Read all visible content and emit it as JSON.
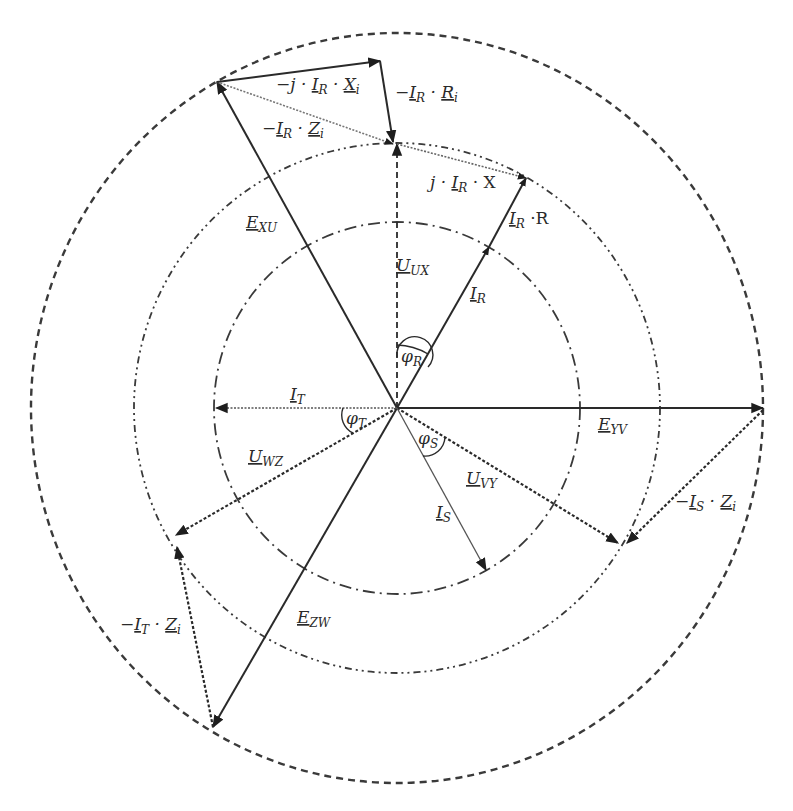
{
  "diagram": {
    "type": "phasor-diagram",
    "center": [
      397,
      408
    ],
    "colors": {
      "line": "#2a2a2a",
      "circle": "#3a3a3a",
      "background": "#ffffff"
    },
    "circles": [
      {
        "name": "outer-circle",
        "rx": 366,
        "ry": 375,
        "style": "dashed"
      },
      {
        "name": "middle-circle",
        "rx": 263,
        "ry": 265,
        "style": "dash-dot-dot"
      },
      {
        "name": "inner-circle",
        "rx": 183,
        "ry": 186,
        "style": "dash-dot"
      }
    ],
    "phasors": [
      {
        "name": "E_XU",
        "label": "E",
        "sub": "XU",
        "from": [
          397,
          408
        ],
        "to": [
          217,
          82
        ],
        "style": "solid"
      },
      {
        "name": "E_YV",
        "label": "E",
        "sub": "YV",
        "from": [
          397,
          408
        ],
        "to": [
          763,
          408
        ],
        "style": "solid"
      },
      {
        "name": "E_ZW",
        "label": "E",
        "sub": "ZW",
        "from": [
          397,
          408
        ],
        "to": [
          213,
          727
        ],
        "style": "solid"
      },
      {
        "name": "U_UX",
        "label": "U",
        "sub": "UX",
        "from": [
          397,
          408
        ],
        "to": [
          397,
          144
        ],
        "style": "dashed"
      },
      {
        "name": "U_VY",
        "label": "U",
        "sub": "VY",
        "from": [
          397,
          408
        ],
        "to": [
          618,
          543
        ],
        "style": "dotted-heavy"
      },
      {
        "name": "U_WZ",
        "label": "U",
        "sub": "WZ",
        "from": [
          397,
          408
        ],
        "to": [
          176,
          535
        ],
        "style": "dotted-heavy"
      },
      {
        "name": "I_R",
        "label": "I",
        "sub": "R",
        "from": [
          397,
          408
        ],
        "to": [
          489,
          247
        ],
        "style": "solid"
      },
      {
        "name": "I_S",
        "label": "I",
        "sub": "S",
        "from": [
          397,
          408
        ],
        "to": [
          486,
          570
        ],
        "style": "thin"
      },
      {
        "name": "I_T",
        "label": "I",
        "sub": "T",
        "from": [
          397,
          408
        ],
        "to": [
          216,
          408
        ],
        "style": "dotted"
      },
      {
        "name": "I_R_R",
        "label": "I_R · R",
        "from": [
          489,
          247
        ],
        "to": [
          526,
          178
        ],
        "style": "solid"
      },
      {
        "name": "j_I_R_X",
        "label": "j · I_R · X",
        "from": [
          397,
          144
        ],
        "to": [
          526,
          178
        ],
        "style": "dotted"
      },
      {
        "name": "minus_I_R_Z_i",
        "label": "−I_R · Z_i",
        "from": [
          217,
          82
        ],
        "to": [
          393,
          144
        ],
        "style": "dotted"
      },
      {
        "name": "minus_j_I_R_X_i",
        "label": "−j · I_R · X_i",
        "from": [
          217,
          82
        ],
        "to": [
          380,
          61
        ],
        "style": "solid"
      },
      {
        "name": "minus_I_R_R_i",
        "label": "−I_R · R_i",
        "from": [
          380,
          61
        ],
        "to": [
          393,
          142
        ],
        "style": "solid"
      },
      {
        "name": "minus_I_S_Z_i",
        "label": "−I_S · Z_i",
        "from": [
          763,
          410
        ],
        "to": [
          627,
          543
        ],
        "style": "dotted-heavy"
      },
      {
        "name": "minus_I_T_Z_i",
        "label": "−I_T · Z_i",
        "from": [
          213,
          727
        ],
        "to": [
          177,
          547
        ],
        "style": "dotted-heavy"
      }
    ],
    "angles": [
      {
        "name": "phi_R",
        "label": "φ",
        "sub": "R"
      },
      {
        "name": "phi_S",
        "label": "φ",
        "sub": "S"
      },
      {
        "name": "phi_T",
        "label": "φ",
        "sub": "T"
      }
    ],
    "labels": {
      "e_xu": {
        "main": "E",
        "sub": "XU"
      },
      "e_yv": {
        "main": "E",
        "sub": "YV"
      },
      "e_zw": {
        "main": "E",
        "sub": "ZW"
      },
      "u_ux": {
        "main": "U",
        "sub": "UX"
      },
      "u_vy": {
        "main": "U",
        "sub": "VY"
      },
      "u_wz": {
        "main": "U",
        "sub": "WZ"
      },
      "i_r": {
        "main": "I",
        "sub": "R"
      },
      "i_s": {
        "main": "I",
        "sub": "S"
      },
      "i_t": {
        "main": "I",
        "sub": "T"
      },
      "i_r_r": {
        "pre": "",
        "main": "I",
        "sub": "R",
        "post": " ·R"
      },
      "j_i_r_x": {
        "pre": "j · ",
        "main": "I",
        "sub": "R",
        "post": " · X"
      },
      "m_i_r_z": {
        "pre": "−",
        "main": "I",
        "sub": "R",
        "mid": " · ",
        "main2": "Z",
        "sub2": "i"
      },
      "m_j_i_r_x": {
        "pre": "−j · ",
        "main": "I",
        "sub": "R",
        "mid": " · ",
        "main2": "X",
        "sub2": "i"
      },
      "m_i_r_r": {
        "pre": "−",
        "main": "I",
        "sub": "R",
        "mid": " · ",
        "main2": "R",
        "sub2": "i"
      },
      "m_i_s_z": {
        "pre": "−",
        "main": "I",
        "sub": "S",
        "mid": " · ",
        "main2": "Z",
        "sub2": "i"
      },
      "m_i_t_z": {
        "pre": "−",
        "main": "I",
        "sub": "T",
        "mid": " · ",
        "main2": "Z",
        "sub2": "i"
      },
      "phi_r": {
        "main": "φ",
        "sub": "R"
      },
      "phi_s": {
        "main": "φ",
        "sub": "S"
      },
      "phi_t": {
        "main": "φ",
        "sub": "T"
      }
    }
  }
}
